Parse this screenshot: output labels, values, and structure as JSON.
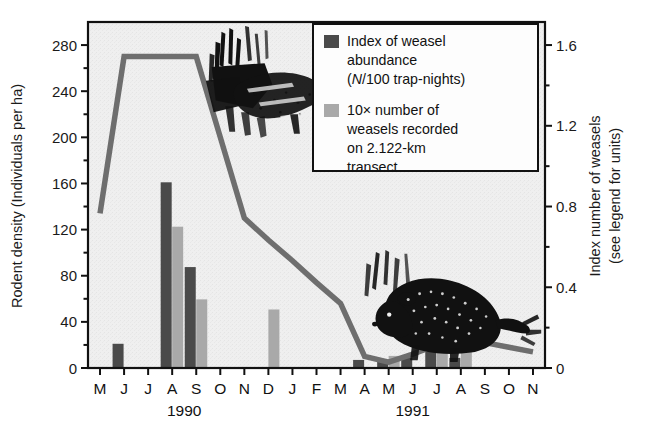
{
  "chart_data": {
    "type": "bar",
    "title": "",
    "subtitle": "",
    "xlabel": "",
    "ylabel": "Rodent density (Individuals per ha)",
    "y2label": "Index number of weasels (see legend for units)",
    "grid": false,
    "legend_position": "top-right",
    "ylim": [
      0,
      300
    ],
    "y2lim": [
      0,
      1.7142
    ],
    "yticks": [
      0,
      40,
      80,
      120,
      160,
      200,
      240,
      280
    ],
    "ytick_labels": [
      "0",
      "40",
      "80",
      "120",
      "160",
      "200",
      "240",
      "280"
    ],
    "y2ticks": [
      0,
      0.4,
      0.8,
      1.2,
      1.6
    ],
    "y2tick_labels": [
      "0",
      "0.4",
      "0.8",
      "1.2",
      "1.6"
    ],
    "categories": [
      "M",
      "J",
      "J",
      "A",
      "S",
      "O",
      "N",
      "D",
      "J",
      "F",
      "M",
      "A",
      "M",
      "J",
      "J",
      "A",
      "S",
      "O",
      "N"
    ],
    "year_groups": [
      {
        "label": "1990",
        "start_index": 0,
        "end_index": 7
      },
      {
        "label": "1991",
        "start_index": 8,
        "end_index": 18
      }
    ],
    "series": [
      {
        "name": "Index of weasel abundance (N/100 trap-nights)",
        "type": "bar",
        "axis": "right",
        "color": "#4a4a4a",
        "values": [
          0,
          0.12,
          0,
          0.92,
          0.5,
          0,
          0,
          0,
          0,
          0,
          0,
          0.04,
          0.03,
          0.05,
          0.13,
          0.05,
          0,
          0,
          0
        ]
      },
      {
        "name": "10x number of weasels recorded on 2.122-km transect",
        "type": "bar",
        "axis": "right",
        "color": "#a9a9a9",
        "values": [
          0,
          0,
          0,
          0.7,
          0.34,
          0,
          0,
          0.29,
          0,
          0,
          0,
          0,
          0.06,
          0,
          0.09,
          0.09,
          0,
          0,
          0
        ]
      },
      {
        "name": "Rodent density",
        "type": "line",
        "axis": "left",
        "color": "#6e6e6e",
        "values": [
          134,
          270,
          270,
          270,
          270,
          200,
          130,
          111,
          93,
          74,
          56,
          10,
          5,
          12,
          20,
          26,
          22,
          18,
          14
        ]
      }
    ]
  },
  "legend": {
    "entries": [
      {
        "swatch_color": "#4a4a4a",
        "line1": "Index of weasel",
        "line2": "abundance",
        "line3_pre": "(",
        "line3_italic": "N",
        "line3_post": "/100 trap-nights)"
      },
      {
        "swatch_color": "#a9a9a9",
        "line1": "10× number of",
        "line2": "weasels recorded",
        "line3": "on 2.122-km",
        "line4": "transect"
      }
    ]
  },
  "axes": {
    "left_title": "Rodent density (Individuals per ha)",
    "right_title_line1": "Index number of weasels",
    "right_title_line2": "(see legend for units)"
  },
  "illustrations": [
    {
      "name": "weasel-illustration",
      "caption": "Weasel (Mustela nivalis) scratchboard drawing"
    },
    {
      "name": "vole-illustration",
      "caption": "Vole / lemming scratchboard drawing"
    }
  ]
}
